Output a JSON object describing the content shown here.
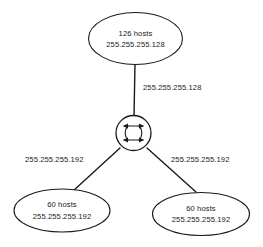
{
  "diagram": {
    "type": "network-topology",
    "title": "",
    "nodes": [
      {
        "id": "top-subnet",
        "shape": "ellipse",
        "line1": "126 hosts",
        "line2": "255.255.255.128"
      },
      {
        "id": "switch",
        "shape": "circle",
        "icon": "switch-icon",
        "label": ""
      },
      {
        "id": "left-subnet",
        "shape": "ellipse",
        "line1": "60 hosts",
        "line2": "255.255.255.192"
      },
      {
        "id": "right-subnet",
        "shape": "ellipse",
        "line1": "60 hosts",
        "line2": "255.255.255.192"
      }
    ],
    "links": [
      {
        "id": "link-top",
        "from": "switch",
        "to": "top-subnet",
        "label": "255.255.255.128"
      },
      {
        "id": "link-left",
        "from": "switch",
        "to": "left-subnet",
        "label": "255.255.255.192"
      },
      {
        "id": "link-right",
        "from": "switch",
        "to": "right-subnet",
        "label": "255.255.255.192"
      }
    ],
    "colors": {
      "background": "#ffffff",
      "stroke": "#1a1a1a",
      "text": "#1a1a1a"
    }
  }
}
